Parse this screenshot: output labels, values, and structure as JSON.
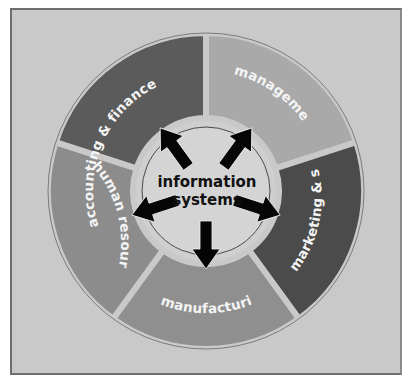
{
  "diagram": {
    "type": "radial-hub",
    "center": {
      "line1": "information",
      "line2": "systems",
      "fill": "#d2d2d2"
    },
    "segments": [
      {
        "id": "management",
        "label": "management",
        "fill": "#a9a9a9"
      },
      {
        "id": "marketing-sales",
        "label": "marketing & sales",
        "fill": "#4b4b4b"
      },
      {
        "id": "manufacturing",
        "label": "manufacturing",
        "fill": "#8f8f8f"
      },
      {
        "id": "human-resources",
        "label": "human resources",
        "fill": "#8c8c8c"
      },
      {
        "id": "accounting-finance",
        "label": "accounting & finance",
        "fill": "#5b5b5b"
      }
    ],
    "arrows": {
      "count": 5,
      "color": "#000000",
      "direction": "outward from center to each segment"
    },
    "background": "#c9c9c9"
  }
}
